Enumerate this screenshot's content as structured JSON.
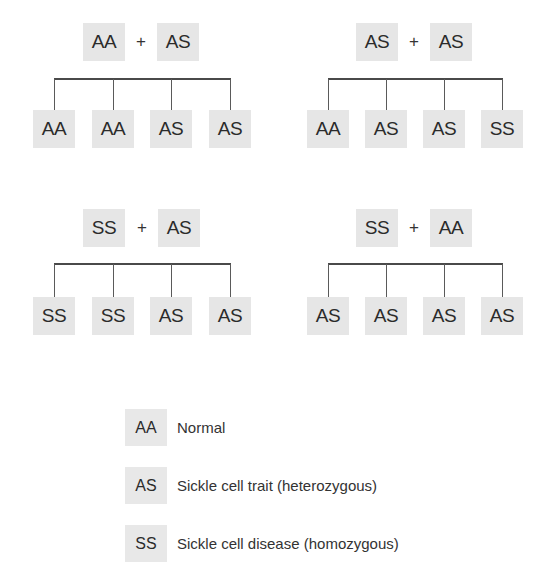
{
  "crosses": [
    {
      "parents": [
        "AA",
        "AS"
      ],
      "operator": "+",
      "offspring": [
        "AA",
        "AA",
        "AS",
        "AS"
      ]
    },
    {
      "parents": [
        "AS",
        "AS"
      ],
      "operator": "+",
      "offspring": [
        "AA",
        "AS",
        "AS",
        "SS"
      ]
    },
    {
      "parents": [
        "SS",
        "AS"
      ],
      "operator": "+",
      "offspring": [
        "SS",
        "SS",
        "AS",
        "AS"
      ]
    },
    {
      "parents": [
        "SS",
        "AA"
      ],
      "operator": "+",
      "offspring": [
        "AS",
        "AS",
        "AS",
        "AS"
      ]
    }
  ],
  "legend": [
    {
      "genotype": "AA",
      "label": "Normal"
    },
    {
      "genotype": "AS",
      "label": "Sickle cell trait (heterozygous)"
    },
    {
      "genotype": "SS",
      "label": "Sickle cell disease (homozygous)"
    }
  ],
  "colors": {
    "box_fill": "#e6e6e6",
    "line": "#4a4a4a",
    "text": "#2b2b2b",
    "background": "#ffffff"
  }
}
